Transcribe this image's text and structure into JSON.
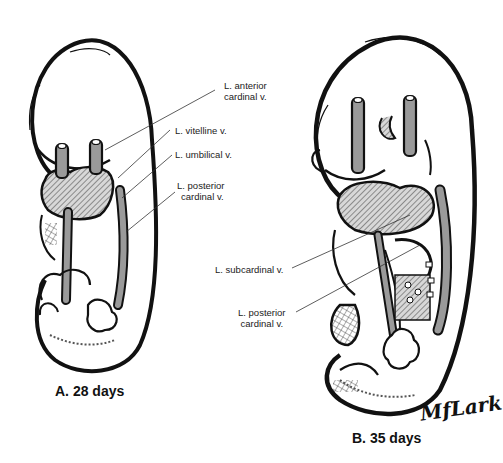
{
  "figure": {
    "panels": [
      {
        "id": "A",
        "caption": "A. 28 days",
        "labels": [
          {
            "line1": "L. anterior",
            "line2": "cardinal v."
          },
          {
            "line1": "L. vitelline v."
          },
          {
            "line1": "L. umbilical v."
          },
          {
            "line1": "L. posterior",
            "line2": "cardinal v."
          }
        ]
      },
      {
        "id": "B",
        "caption": "B. 35 days",
        "labels": [
          {
            "line1": "L. subcardinal v."
          },
          {
            "line1": "L. posterior",
            "line2": "cardinal v."
          }
        ]
      }
    ],
    "signature": "MfLark",
    "colors": {
      "ink": "#111111",
      "vessel_fill": "#9a9a9a",
      "background": "#ffffff"
    }
  }
}
